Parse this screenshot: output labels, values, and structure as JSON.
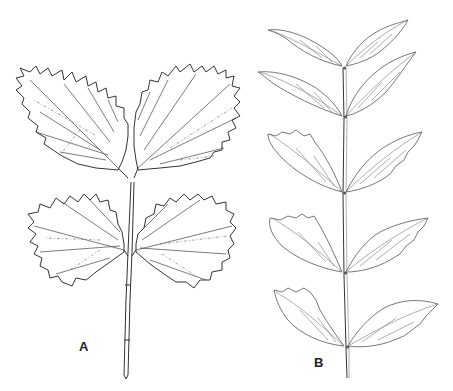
{
  "figure": {
    "type": "botanical line drawing",
    "panels": [
      {
        "id": "A",
        "label": "A",
        "description": "Compound leaf with four coarsely serrated ovate leaflets arranged in two opposite pairs on a short stalk"
      },
      {
        "id": "B",
        "label": "B",
        "description": "Pinnately compound leaf with five opposite pairs of lanceolate to ovate leaflets along a long rachis"
      }
    ]
  },
  "colors": {
    "background": "#ffffff",
    "ink": "#333333"
  }
}
